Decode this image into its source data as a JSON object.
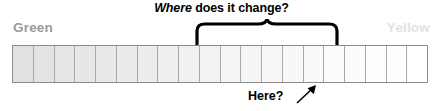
{
  "title": {
    "emphasis": "Where",
    "rest": " does it change?"
  },
  "labels": {
    "left": "Green",
    "right": "Yellow"
  },
  "annotation": {
    "here": "Here?"
  },
  "colors": {
    "left_label": "#9a9a9a",
    "right_label": "#e2e2e2",
    "strip_border": "#8c8c8c",
    "cell_divider": "#a8a8a8",
    "ink": "#000000",
    "gradient_start": "#e1e1e1",
    "gradient_end": "#ffffff"
  },
  "chart_data": {
    "type": "heatmap",
    "title": "Where does it change?",
    "orientation": "horizontal",
    "cell_count": 20,
    "categories": [
      "1",
      "2",
      "3",
      "4",
      "5",
      "6",
      "7",
      "8",
      "9",
      "10",
      "11",
      "12",
      "13",
      "14",
      "15",
      "16",
      "17",
      "18",
      "19",
      "20"
    ],
    "values": [
      0.88,
      0.89,
      0.9,
      0.91,
      0.92,
      0.93,
      0.94,
      0.95,
      0.955,
      0.96,
      0.965,
      0.97,
      0.975,
      0.98,
      0.985,
      0.99,
      0.992,
      0.995,
      0.997,
      1.0
    ],
    "value_meaning": "relative lightness of each cell, 0.88 = light gray, 1.0 = white",
    "cell_fills": [
      "#e1e1e1",
      "#e3e3e3",
      "#e5e5e5",
      "#e7e7e7",
      "#e9e9e9",
      "#ebebeb",
      "#ededed",
      "#efefef",
      "#f1f1f1",
      "#f2f2f2",
      "#f4f4f4",
      "#f5f5f5",
      "#f7f7f7",
      "#f8f8f8",
      "#fafafa",
      "#fbfbfb",
      "#fcfcfc",
      "#fdfdfd",
      "#fefefe",
      "#ffffff"
    ],
    "endpoint_labels": {
      "start": "Green",
      "end": "Yellow"
    },
    "annotations": [
      {
        "text": "Where does it change?",
        "position": "above",
        "spans_cells": [
          9,
          16
        ],
        "marker": "curly-brace"
      },
      {
        "text": "Here?",
        "position": "below",
        "marker": "arrow",
        "points_to_cell": 15
      }
    ],
    "grid": true,
    "legend": "none"
  }
}
